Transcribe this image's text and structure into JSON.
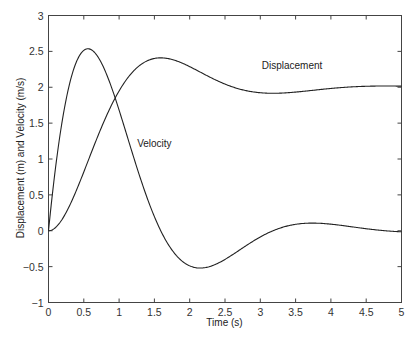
{
  "chart_data": {
    "type": "line",
    "title": "",
    "xlabel": "Time (s)",
    "ylabel": "Displacement (m) and Velocity (m/s)",
    "xlim": [
      0,
      5
    ],
    "ylim": [
      -1,
      3
    ],
    "grid": false,
    "legend": null,
    "x_ticks": [
      "0",
      "0.5",
      "1",
      "1.5",
      "2",
      "2.5",
      "3",
      "3.5",
      "4",
      "4.5",
      "5"
    ],
    "y_ticks": [
      "-1",
      "-0.5",
      "0",
      "0.5",
      "1",
      "1.5",
      "2",
      "2.5",
      "3"
    ],
    "annotations": [
      {
        "text": "Displacement",
        "x": 3.45,
        "y": 2.25
      },
      {
        "text": "Velocity",
        "x": 1.5,
        "y": 1.17
      }
    ],
    "x": [
      0,
      0.25,
      0.5,
      0.75,
      1.0,
      1.25,
      1.5,
      1.75,
      2.0,
      2.25,
      2.5,
      2.75,
      3.0,
      3.25,
      3.5,
      3.75,
      4.0,
      4.25,
      4.5,
      4.75,
      5.0
    ],
    "series": [
      {
        "name": "Displacement",
        "color": "#222222",
        "values": [
          0.0,
          0.14,
          0.5,
          0.97,
          1.44,
          1.85,
          2.17,
          2.36,
          2.43,
          2.4,
          2.3,
          2.18,
          2.06,
          1.97,
          1.92,
          1.91,
          1.93,
          1.96,
          1.99,
          2.01,
          2.02
        ]
      },
      {
        "name": "Velocity",
        "color": "#222222",
        "values": [
          0.0,
          1.65,
          2.52,
          2.51,
          1.99,
          1.27,
          0.55,
          -0.02,
          -0.38,
          -0.54,
          -0.53,
          -0.41,
          -0.25,
          -0.09,
          0.03,
          0.09,
          0.1,
          0.08,
          0.04,
          0.0,
          -0.02
        ]
      }
    ]
  },
  "model": {
    "sigma": 0.997,
    "omega_d": 1.976,
    "final_value": 2
  }
}
